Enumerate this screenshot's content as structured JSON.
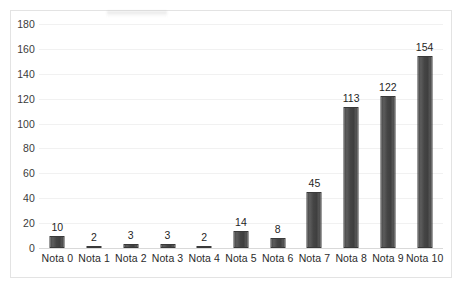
{
  "chart_data": {
    "type": "bar",
    "title": "",
    "subtitle": "",
    "xlabel": "",
    "ylabel": "",
    "categories": [
      "Nota 0",
      "Nota 1",
      "Nota 2",
      "Nota 3",
      "Nota 4",
      "Nota 5",
      "Nota 6",
      "Nota 7",
      "Nota 8",
      "Nota 9",
      "Nota 10"
    ],
    "values": [
      10,
      2,
      3,
      3,
      2,
      14,
      8,
      45,
      113,
      122,
      154
    ],
    "value_labels": [
      "10",
      "2",
      "3",
      "3",
      "2",
      "14",
      "8",
      "45",
      "113",
      "122",
      "154"
    ],
    "ylim": [
      0,
      180
    ],
    "ytick_step": 20,
    "ytick_labels": [
      "180",
      "160",
      "140",
      "120",
      "100",
      "80",
      "60",
      "40",
      "20",
      "0"
    ],
    "ytick_values": [
      180,
      160,
      140,
      120,
      100,
      80,
      60,
      40,
      20,
      0
    ],
    "grid": true,
    "grid_axis": "y",
    "legend": false,
    "legend_position": "none",
    "bar_color": "#474747",
    "grid_color": "#f1f1f1",
    "axis_color": "#d9d9d9",
    "text_color": "#2b2b2b",
    "background_color": "#ffffff",
    "border_color": "#e3e3e3"
  }
}
